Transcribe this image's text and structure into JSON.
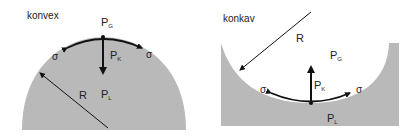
{
  "left": {
    "title": "konvex",
    "pressure_gas": "P",
    "pressure_gas_sub": "G",
    "pressure_capillary": "P",
    "pressure_capillary_sub": "K",
    "pressure_liquid": "P",
    "pressure_liquid_sub": "L",
    "radius": "R",
    "sigma_left": "σ",
    "sigma_right": "σ"
  },
  "right": {
    "title": "konkav",
    "pressure_gas": "P",
    "pressure_gas_sub": "G",
    "pressure_capillary": "P",
    "pressure_capillary_sub": "K",
    "pressure_liquid": "P",
    "pressure_liquid_sub": "L",
    "radius": "R",
    "sigma_left": "σ",
    "sigma_right": "σ"
  },
  "colors": {
    "liquid": "#b9b9b9",
    "line": "#111111"
  }
}
